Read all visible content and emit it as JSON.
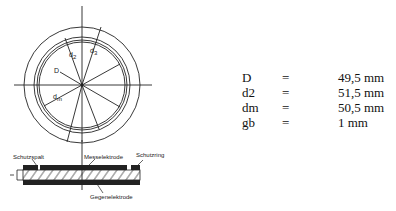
{
  "diagram": {
    "circle_labels": {
      "d2": "d",
      "d2_sub": "2",
      "d3": "d",
      "d3_sub": "3",
      "D": "D",
      "dm": "d",
      "dm_sub": "m"
    },
    "cross_section_labels": {
      "guard_gap": "Schutzspalt",
      "measuring_electrode": "Messelektrode",
      "guard_ring": "Schutzring",
      "counter_electrode": "Gegenelektrode"
    }
  },
  "dimensions": [
    {
      "symbol": "D",
      "eq": "=",
      "value": "49,5 mm"
    },
    {
      "symbol": "d2",
      "eq": "=",
      "value": "51,5 mm"
    },
    {
      "symbol": "dm",
      "eq": "=",
      "value": "50,5 mm"
    },
    {
      "symbol": "gb",
      "eq": "=",
      "value": "1 mm"
    }
  ]
}
